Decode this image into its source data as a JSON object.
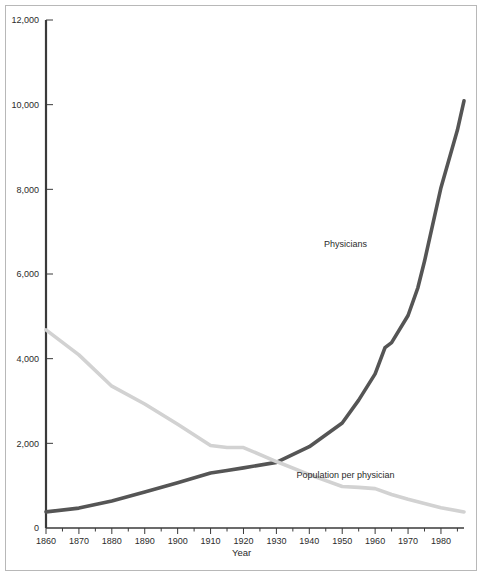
{
  "chart_data": {
    "type": "line",
    "title": "",
    "xlabel": "Year",
    "ylabel": "",
    "grid": false,
    "legend_position": "inline-annotations",
    "xlim": [
      1860,
      1987
    ],
    "ylim": [
      0,
      12000
    ],
    "x_ticks": [
      1860,
      1870,
      1880,
      1890,
      1900,
      1910,
      1920,
      1930,
      1940,
      1950,
      1960,
      1970,
      1980
    ],
    "x_tick_labels": [
      "1860",
      "1870",
      "1880",
      "1890",
      "1900",
      "1910",
      "1920",
      "1930",
      "1940",
      "1950",
      "1960",
      "1970",
      "1980"
    ],
    "x_minor_ticks": [
      1865,
      1875,
      1885,
      1895,
      1905,
      1915,
      1925,
      1935,
      1945,
      1955,
      1965,
      1975,
      1985
    ],
    "y_ticks": [
      0,
      2000,
      4000,
      6000,
      8000,
      10000,
      12000
    ],
    "y_tick_labels": [
      "0",
      "2,000",
      "4,000",
      "6,000",
      "8,000",
      "10,000",
      "12,000"
    ],
    "series": [
      {
        "name": "Physicians",
        "color": "#555555",
        "label_x": 1951,
        "label_y": 6640,
        "x": [
          1860,
          1870,
          1880,
          1890,
          1900,
          1910,
          1915,
          1920,
          1930,
          1940,
          1950,
          1955,
          1960,
          1963,
          1965,
          1970,
          1973,
          1975,
          1980,
          1985,
          1987
        ],
        "y": [
          380,
          470,
          640,
          850,
          1070,
          1300,
          1360,
          1420,
          1550,
          1920,
          2480,
          3020,
          3640,
          4260,
          4380,
          5020,
          5680,
          6300,
          8040,
          9400,
          10090
        ]
      },
      {
        "name": "Population per physician",
        "color": "#d2d2d2",
        "label_x": 1951,
        "label_y": 1170,
        "x": [
          1860,
          1870,
          1880,
          1890,
          1900,
          1910,
          1915,
          1920,
          1930,
          1940,
          1950,
          1955,
          1960,
          1965,
          1970,
          1980,
          1987
        ],
        "y": [
          4680,
          4090,
          3350,
          2930,
          2450,
          1950,
          1900,
          1900,
          1570,
          1260,
          980,
          960,
          930,
          790,
          680,
          480,
          380
        ]
      }
    ],
    "annotations": [
      {
        "text": "Physicians",
        "x": 1951,
        "y": 6640
      },
      {
        "text": "Population per physician",
        "x": 1951,
        "y": 1170
      }
    ]
  },
  "axes": {
    "x_title": "Year",
    "y_title": ""
  }
}
